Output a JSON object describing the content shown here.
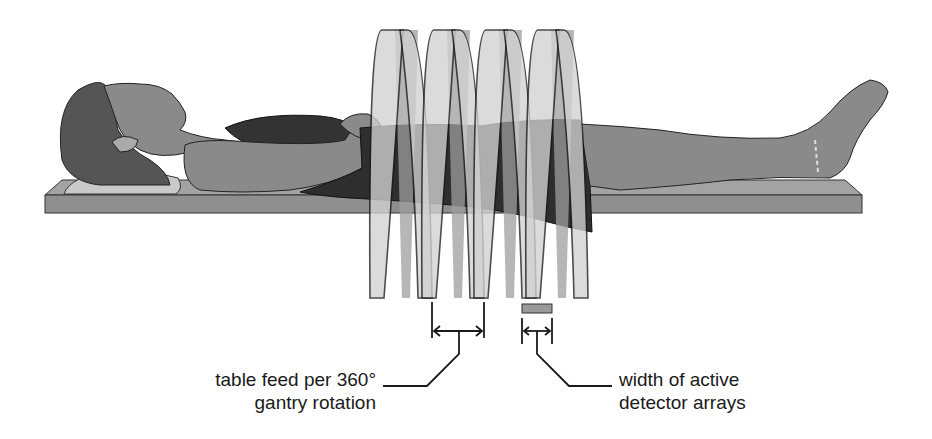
{
  "diagram": {
    "labels": {
      "table_feed": {
        "line1": "table feed per 360°",
        "line2": "gantry rotation"
      },
      "detector_width": {
        "line1": "width of active",
        "line2": "detector arrays"
      }
    },
    "elements": {
      "patient": "patient-lying-supine",
      "table": "patient-table",
      "helix": "x-ray-beam-helical-path",
      "helix_loops": 4,
      "detector": "active-detector-array-block"
    },
    "colors": {
      "background": "#ffffff",
      "skin": "#8a8a8a",
      "hair": "#555555",
      "clothing": "#2e2e2e",
      "table_top": "#9a9a9a",
      "table_side": "#8f8f8f",
      "helix_front": "#d2d2d2",
      "helix_back": "#9d9d9d",
      "outline": "#1a1a1a",
      "detector_fill": "#9a9a9a"
    }
  }
}
